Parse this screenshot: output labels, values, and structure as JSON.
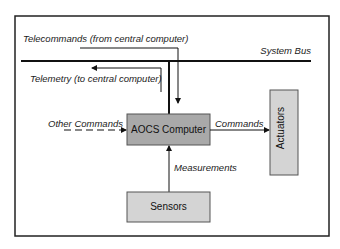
{
  "diagram": {
    "bus_label": "System Bus",
    "telecommands_label": "Telecommands (from central computer)",
    "telemetry_label": "Telemetry (to central computer)",
    "other_commands_label": "Other Commands",
    "commands_label": "Commands",
    "measurements_label": "Measurements",
    "blocks": {
      "aocs": "AOCS Computer",
      "actuators": "Actuators",
      "sensors": "Sensors"
    },
    "colors": {
      "aocs_fill": "#a9a9a9",
      "block_fill": "#d4d4d4",
      "line": "#111111"
    }
  }
}
